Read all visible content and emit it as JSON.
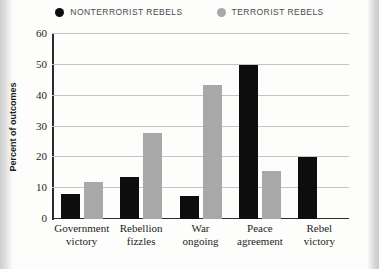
{
  "legend": {
    "entries": [
      {
        "label": "NONTERRORIST REBELS",
        "color": "#0d0d0d",
        "marker": "filled-circle"
      },
      {
        "label": "TERRORIST REBELS",
        "color": "#a8a8a8",
        "marker": "filled-circle"
      }
    ]
  },
  "axes": {
    "y_title": "Percent of outcomes",
    "y_ticks": [
      "0",
      "10",
      "20",
      "30",
      "40",
      "50",
      "60"
    ]
  },
  "categories_wrapped": [
    {
      "line1": "Government",
      "line2": "victory"
    },
    {
      "line1": "Rebellion",
      "line2": "fizzles"
    },
    {
      "line1": "War",
      "line2": "ongoing"
    },
    {
      "line1": "Peace",
      "line2": "agreement"
    },
    {
      "line1": "Rebel",
      "line2": "victory"
    }
  ],
  "chart_data": {
    "type": "bar",
    "title": "",
    "subtitle": "",
    "xlabel": "",
    "ylabel": "Percent of outcomes",
    "ylim": [
      0,
      60
    ],
    "ytick_step": 10,
    "grid": "horizontal",
    "legend_position": "top-center",
    "categories": [
      "Government victory",
      "Rebellion fizzles",
      "War ongoing",
      "Peace agreement",
      "Rebel victory"
    ],
    "series": [
      {
        "name": "NONTERRORIST REBELS",
        "color": "#0d0d0d",
        "values": [
          8,
          13.5,
          7.5,
          50,
          20
        ]
      },
      {
        "name": "TERRORIST REBELS",
        "color": "#a8a8a8",
        "values": [
          12,
          28,
          43.5,
          15.5,
          null
        ]
      }
    ]
  }
}
